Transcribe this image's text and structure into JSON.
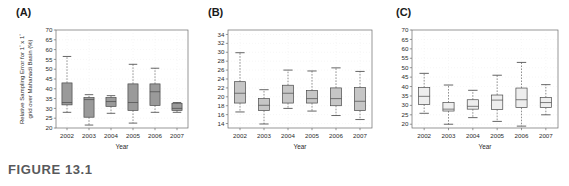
{
  "figure": {
    "caption": "FIGURE 13.1",
    "panels": [
      {
        "tag": "(A)",
        "id": "panel-a"
      },
      {
        "tag": "(B)",
        "id": "panel-b"
      },
      {
        "tag": "(C)",
        "id": "panel-c"
      }
    ]
  },
  "axis_titles": {
    "x": "Year",
    "y_a_line1": "Relative Sampling Error for 1",
    "y_a_deg1": "°",
    "y_a_mid": " x 1",
    "y_a_deg2": "°",
    "y_a_line2": "grid over Mahanadi Basin (%)"
  },
  "colors": {
    "box_fill_a": "#9a9a9a",
    "box_fill_b": "#c6c6c6",
    "box_fill_c": "#eeeeee",
    "box_stroke": "#4a4a4a",
    "axis": "#6b6b6b",
    "grid": "#d8d8d8",
    "caption": "#58595b",
    "text": "#2b2b2b"
  },
  "chart_data": [
    {
      "type": "box",
      "panel": "(A)",
      "title": "",
      "xlabel": "Year",
      "ylabel": "Relative Sampling Error for 1° x 1° grid over Mahanadi Basin (%)",
      "categories": [
        "2002",
        "2003",
        "2004",
        "2005",
        "2006",
        "2007"
      ],
      "ylim": [
        20,
        70
      ],
      "yticks": [
        20,
        25,
        30,
        35,
        40,
        45,
        50,
        55,
        60,
        65,
        70
      ],
      "grid": true,
      "legend": "none",
      "boxes": [
        {
          "category": "2002",
          "whisker_low": 28.0,
          "q1": 31.8,
          "median": 33.0,
          "q3": 43.0,
          "whisker_high": 56.5
        },
        {
          "category": "2003",
          "whisker_low": 21.5,
          "q1": 25.5,
          "median": 34.5,
          "q3": 35.5,
          "whisker_high": 37.0
        },
        {
          "category": "2004",
          "whisker_low": 27.5,
          "q1": 31.0,
          "median": 33.5,
          "q3": 35.5,
          "whisker_high": 36.5
        },
        {
          "category": "2005",
          "whisker_low": 22.5,
          "q1": 29.0,
          "median": 33.0,
          "q3": 42.5,
          "whisker_high": 52.5
        },
        {
          "category": "2006",
          "whisker_low": 28.0,
          "q1": 31.5,
          "median": 38.5,
          "q3": 42.5,
          "whisker_high": 50.5
        },
        {
          "category": "2007",
          "whisker_low": 28.0,
          "q1": 29.0,
          "median": 30.0,
          "q3": 32.5,
          "whisker_high": 33.0
        }
      ]
    },
    {
      "type": "box",
      "panel": "(B)",
      "title": "",
      "xlabel": "Year",
      "ylabel": "",
      "categories": [
        "2002",
        "2003",
        "2004",
        "2005",
        "2006",
        "2007"
      ],
      "ylim": [
        13,
        35
      ],
      "yticks": [
        14,
        16,
        18,
        20,
        22,
        24,
        26,
        28,
        30,
        32,
        34
      ],
      "grid": true,
      "legend": "none",
      "boxes": [
        {
          "category": "2002",
          "whisker_low": 16.6,
          "q1": 18.6,
          "median": 20.8,
          "q3": 23.4,
          "whisker_high": 29.9
        },
        {
          "category": "2003",
          "whisker_low": 13.9,
          "q1": 16.9,
          "median": 18.1,
          "q3": 19.6,
          "whisker_high": 21.6
        },
        {
          "category": "2004",
          "whisker_low": 17.4,
          "q1": 18.6,
          "median": 20.8,
          "q3": 22.6,
          "whisker_high": 26.0
        },
        {
          "category": "2005",
          "whisker_low": 16.8,
          "q1": 18.6,
          "median": 19.6,
          "q3": 21.4,
          "whisker_high": 25.8
        },
        {
          "category": "2006",
          "whisker_low": 15.8,
          "q1": 18.0,
          "median": 19.6,
          "q3": 22.0,
          "whisker_high": 26.5
        },
        {
          "category": "2007",
          "whisker_low": 14.9,
          "q1": 16.9,
          "median": 19.0,
          "q3": 22.1,
          "whisker_high": 25.7
        }
      ]
    },
    {
      "type": "box",
      "panel": "(C)",
      "title": "",
      "xlabel": "Year",
      "ylabel": "",
      "categories": [
        "2002",
        "2003",
        "2004",
        "2005",
        "2006",
        "2007"
      ],
      "ylim": [
        18,
        70
      ],
      "yticks": [
        20,
        25,
        30,
        35,
        40,
        45,
        50,
        55,
        60,
        65,
        70
      ],
      "grid": true,
      "legend": "none",
      "boxes": [
        {
          "category": "2002",
          "whisker_low": 25.8,
          "q1": 30.5,
          "median": 34.8,
          "q3": 39.5,
          "whisker_high": 47.0
        },
        {
          "category": "2003",
          "whisker_low": 20.0,
          "q1": 27.0,
          "median": 28.0,
          "q3": 31.5,
          "whisker_high": 40.8
        },
        {
          "category": "2004",
          "whisker_low": 23.5,
          "q1": 28.0,
          "median": 29.5,
          "q3": 33.0,
          "whisker_high": 38.0
        },
        {
          "category": "2005",
          "whisker_low": 21.5,
          "q1": 27.8,
          "median": 32.8,
          "q3": 35.5,
          "whisker_high": 46.0
        },
        {
          "category": "2006",
          "whisker_low": 19.0,
          "q1": 28.8,
          "median": 33.0,
          "q3": 39.2,
          "whisker_high": 52.8
        },
        {
          "category": "2007",
          "whisker_low": 25.0,
          "q1": 28.8,
          "median": 31.5,
          "q3": 34.2,
          "whisker_high": 41.0
        }
      ]
    }
  ]
}
